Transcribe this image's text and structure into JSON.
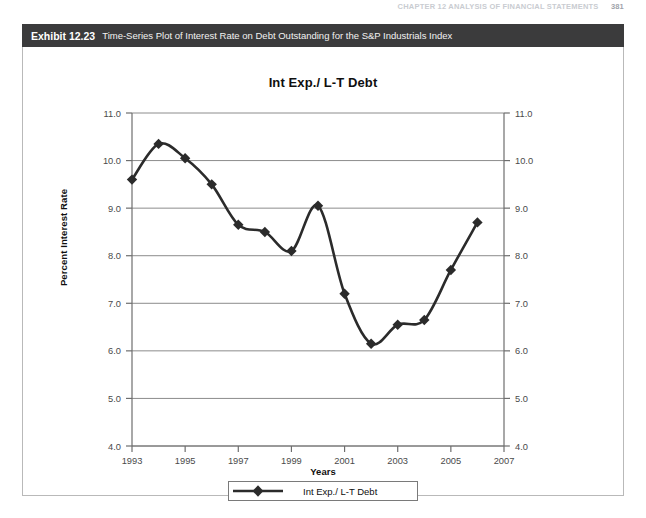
{
  "running_head": {
    "text": "CHAPTER 12  ANALYSIS OF FINANCIAL STATEMENTS",
    "page_number": "381"
  },
  "exhibit": {
    "number": "Exhibit 12.23",
    "caption": "Time-Series Plot of Interest Rate on Debt Outstanding for the S&P Industrials Index"
  },
  "legend": {
    "label": "Int Exp./ L-T Debt",
    "marker": "diamond-marker"
  },
  "colors": {
    "header_bg": "#3b3b3c",
    "header_text": "#ffffff",
    "plot_border": "#6e6e6e",
    "gridline": "#8c8c8c",
    "series_line": "#2b2b2b",
    "panel_border": "#b9b9b9"
  },
  "chart_data": {
    "type": "line",
    "title": "Int Exp./ L-T Debt",
    "xlabel": "Years",
    "ylabel": "Percent Interest Rate",
    "grid": true,
    "legend_position": "bottom",
    "xlim": [
      1993,
      2007
    ],
    "ylim": [
      4.0,
      11.0
    ],
    "xticks": [
      1993,
      1995,
      1997,
      1999,
      2001,
      2003,
      2005,
      2007
    ],
    "xtick_labels": [
      "1993",
      "1995",
      "1997",
      "1999",
      "2001",
      "2003",
      "2005",
      "2007"
    ],
    "yticks": [
      4.0,
      5.0,
      6.0,
      7.0,
      8.0,
      9.0,
      10.0,
      11.0
    ],
    "ytick_labels": [
      "4.0",
      "5.0",
      "6.0",
      "7.0",
      "8.0",
      "9.0",
      "10.0",
      "11.0"
    ],
    "right_axis": true,
    "right_ytick_labels": [
      "4.0",
      "5.0",
      "6.0",
      "7.0",
      "8.0",
      "9.0",
      "10.0",
      "11.0"
    ],
    "x": [
      1993,
      1994,
      1995,
      1996,
      1997,
      1998,
      1999,
      2000,
      2001,
      2002,
      2003,
      2004,
      2005,
      2006
    ],
    "series": [
      {
        "name": "Int Exp./ L-T Debt",
        "values": [
          9.6,
          10.35,
          10.05,
          9.5,
          8.65,
          8.5,
          8.1,
          9.05,
          7.2,
          6.15,
          6.55,
          6.65,
          7.7,
          8.7
        ]
      }
    ]
  }
}
